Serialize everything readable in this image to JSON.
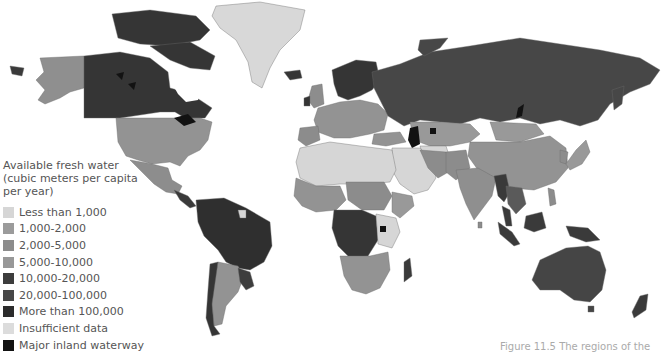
{
  "legend": {
    "title": "Available fresh water (cubic meters per capita per year)",
    "items": [
      {
        "label": "Less than 1,000",
        "color": "#d6d6d6"
      },
      {
        "label": "1,000-2,000",
        "color": "#9b9b9b"
      },
      {
        "label": "2,000-5,000",
        "color": "#8c8c8c"
      },
      {
        "label": "5,000-10,000",
        "color": "#989898"
      },
      {
        "label": "10,000-20,000",
        "color": "#3d3d3d"
      },
      {
        "label": "20,000-100,000",
        "color": "#474747"
      },
      {
        "label": "More than 100,000",
        "color": "#2c2c2c"
      },
      {
        "label": "Insufficient data",
        "color": "#dcdcdc"
      },
      {
        "label": "Major inland waterway",
        "color": "#121212"
      }
    ]
  },
  "caption": "Figure 11.5 The regions of the",
  "colors": {
    "ocean": "#ffffff",
    "border": "#6a6a6a"
  }
}
